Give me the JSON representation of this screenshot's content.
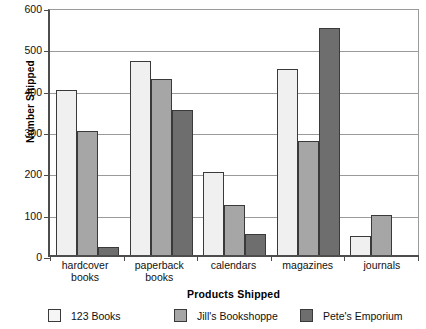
{
  "chart_data": {
    "type": "bar",
    "title": "",
    "xlabel": "Products Shipped",
    "ylabel": "Number Shipped",
    "categories": [
      "hardcover books",
      "paperback books",
      "calendars",
      "magazines",
      "journals"
    ],
    "category_lines": [
      [
        "hardcover",
        "books"
      ],
      [
        "paperback",
        "books"
      ],
      [
        "calendars"
      ],
      [
        "magazines"
      ],
      [
        "journals"
      ]
    ],
    "series": [
      {
        "name": "123 Books",
        "color": "#f0f0f0",
        "values": [
          400,
          470,
          200,
          450,
          45
        ]
      },
      {
        "name": "Jill's Bookshoppe",
        "color": "#a6a6a6",
        "values": [
          300,
          425,
          120,
          275,
          98
        ]
      },
      {
        "name": "Pete's Emporium",
        "color": "#6e6e6e",
        "values": [
          20,
          350,
          50,
          550,
          0
        ]
      }
    ],
    "ylim": [
      0,
      600
    ],
    "yticks": [
      0,
      100,
      200,
      300,
      400,
      500,
      600
    ],
    "ytick_labels": [
      "0",
      "100",
      "200",
      "300",
      "400",
      "500",
      "600"
    ],
    "grid": true,
    "legend_position": "bottom"
  },
  "legend": {
    "items": [
      {
        "label": "123 Books",
        "swatch": "legend-swatch-123-books"
      },
      {
        "label": "Jill's Bookshoppe",
        "swatch": "legend-swatch-jills-bookshoppe"
      },
      {
        "label": "Pete's Emporium",
        "swatch": "legend-swatch-petes-emporium"
      }
    ]
  },
  "axes": {
    "y_title": "Number Shipped",
    "x_title": "Products Shipped"
  }
}
